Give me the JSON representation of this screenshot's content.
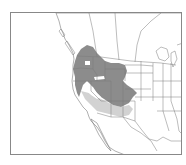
{
  "caption": {
    "text": ""
  },
  "map": {
    "title": "Range map of western North America",
    "colors": {
      "background": "#ffffff",
      "border": "#888888",
      "state_lines": "#7a7a7a",
      "primary_range": "#8c8c8c",
      "secondary_range": "#d2d2d2"
    },
    "legend": [
      {
        "name": "primary-range",
        "color": "#8c8c8c"
      },
      {
        "name": "secondary-range",
        "color": "#d2d2d2"
      }
    ]
  }
}
